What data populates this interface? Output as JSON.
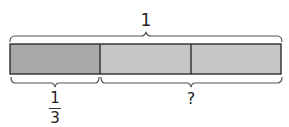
{
  "diagram": {
    "type": "bar-model",
    "whole_label": "1",
    "segments": [
      {
        "index": 0,
        "fill": "#a8a8a8",
        "shaded": true
      },
      {
        "index": 1,
        "fill": "#c5c5c5",
        "shaded": false
      },
      {
        "index": 2,
        "fill": "#c5c5c5",
        "shaded": false
      }
    ],
    "known_part": {
      "numerator": "1",
      "denominator": "3",
      "spans_segments": 1
    },
    "unknown_part": {
      "label": "?",
      "spans_segments": 2
    },
    "colors": {
      "outline": "#2e2e2e",
      "brace": "#555555",
      "text": "#222222"
    }
  }
}
